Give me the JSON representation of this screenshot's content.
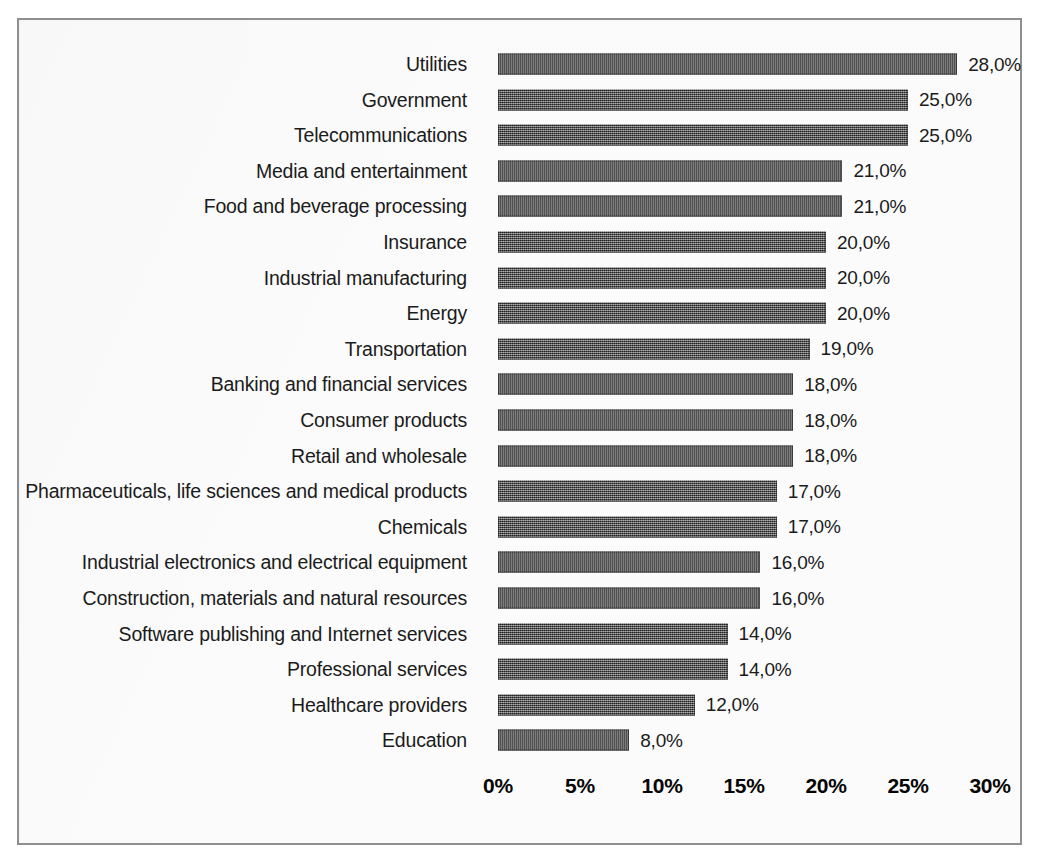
{
  "chart_data": {
    "type": "bar",
    "orientation": "horizontal",
    "title": "",
    "subtitle": "",
    "xlabel": "",
    "ylabel": "",
    "xlim": [
      0,
      30
    ],
    "xticks": [
      0,
      5,
      10,
      15,
      20,
      25,
      30
    ],
    "xtick_labels": [
      "0%",
      "5%",
      "10%",
      "15%",
      "20%",
      "25%",
      "30%"
    ],
    "grid": false,
    "legend": null,
    "value_label_format": "comma-decimal-percent",
    "bar_color": "#5e5e5e",
    "frame_color": "#8f8f8f",
    "background_color": "#fbfbfb",
    "text_color": "#1b1b1b",
    "categories": [
      "Utilities",
      "Government",
      "Telecommunications",
      "Media and entertainment",
      "Food and beverage processing",
      "Insurance",
      "Industrial manufacturing",
      "Energy",
      "Transportation",
      "Banking and financial services",
      "Consumer products",
      "Retail and wholesale",
      "Pharmaceuticals, life sciences and medical products",
      "Chemicals",
      "Industrial electronics and electrical equipment",
      "Construction, materials and natural resources",
      "Software publishing and Internet services",
      "Professional services",
      "Healthcare providers",
      "Education"
    ],
    "values": [
      28,
      25,
      25,
      21,
      21,
      20,
      20,
      20,
      19,
      18,
      18,
      18,
      17,
      17,
      16,
      16,
      14,
      14,
      12,
      8
    ],
    "value_labels": [
      "28,0%",
      "25,0%",
      "25,0%",
      "21,0%",
      "21,0%",
      "20,0%",
      "20,0%",
      "20,0%",
      "19,0%",
      "18,0%",
      "18,0%",
      "18,0%",
      "17,0%",
      "17,0%",
      "16,0%",
      "16,0%",
      "14,0%",
      "14,0%",
      "12,0%",
      "8,0%"
    ]
  }
}
